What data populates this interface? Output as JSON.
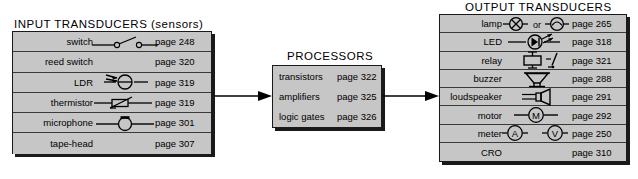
{
  "diagram": {
    "title_input": "INPUT  TRANSDUCERS  (sensors)",
    "title_processors": "PROCESSORS",
    "title_output": "OUTPUT  TRANSDUCERS",
    "colors": {
      "panel_fill": "#c6c6c6",
      "panel_border": "#1a1a1a",
      "shadow": "#1a1a1a",
      "text": "#000000",
      "background": "#ffffff"
    },
    "flow": [
      {
        "name": "arrow-input-to-processors",
        "from": "INPUT TRANSDUCERS",
        "to": "PROCESSORS",
        "direction": "right"
      },
      {
        "name": "arrow-processors-to-output",
        "from": "PROCESSORS",
        "to": "OUTPUT TRANSDUCERS",
        "direction": "right"
      }
    ]
  },
  "input_transducers": {
    "heading": "INPUT  TRANSDUCERS  (sensors)",
    "rows": [
      {
        "label": "switch",
        "symbol": "switch-symbol",
        "page": "page 248"
      },
      {
        "label": "reed switch",
        "symbol": "none",
        "page": "page 320"
      },
      {
        "label": "LDR",
        "symbol": "ldr-symbol",
        "page": "page 319"
      },
      {
        "label": "thermistor",
        "symbol": "thermistor-symbol",
        "page": "page 319"
      },
      {
        "label": "microphone",
        "symbol": "microphone-symbol",
        "page": "page 301"
      },
      {
        "label": "tape-head",
        "symbol": "none",
        "page": "page 307"
      }
    ]
  },
  "processors": {
    "heading": "PROCESSORS",
    "rows": [
      {
        "label": "transistors",
        "page": "page 322"
      },
      {
        "label": "amplifiers",
        "page": "page 325"
      },
      {
        "label": "logic gates",
        "page": "page 326"
      }
    ]
  },
  "output_transducers": {
    "heading": "OUTPUT  TRANSDUCERS",
    "lamp_or_text": "or",
    "motor_letter": "M",
    "meter_ammeter_letter": "A",
    "meter_voltmeter_letter": "V",
    "rows": [
      {
        "label": "lamp",
        "symbol": "lamp-symbol",
        "page": "page 265"
      },
      {
        "label": "LED",
        "symbol": "led-symbol",
        "page": "page 318"
      },
      {
        "label": "relay",
        "symbol": "relay-symbol",
        "page": "page 321"
      },
      {
        "label": "buzzer",
        "symbol": "buzzer-symbol",
        "page": "page 288"
      },
      {
        "label": "loudspeaker",
        "symbol": "loudspeaker-symbol",
        "page": "page 291"
      },
      {
        "label": "motor",
        "symbol": "motor-symbol",
        "page": "page 292"
      },
      {
        "label": "meter",
        "symbol": "meter-symbol",
        "page": "page 250"
      },
      {
        "label": "CRO",
        "symbol": "none",
        "page": "page 310"
      }
    ]
  }
}
